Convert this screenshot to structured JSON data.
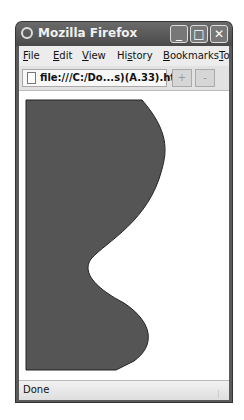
{
  "window": {
    "title": "Mozilla Firefox",
    "controls": {
      "minimize": "_",
      "maximize": "□",
      "close": "✕"
    }
  },
  "menubar": {
    "items": [
      {
        "label": "File",
        "accel": "F",
        "rest": "ile"
      },
      {
        "label": "Edit",
        "accel": "E",
        "rest": "dit"
      },
      {
        "label": "View",
        "accel": "V",
        "rest": "iew"
      },
      {
        "label": "History",
        "accel": "s",
        "pre": "Hi",
        "rest": "tory"
      },
      {
        "label": "Bookmarks",
        "accel": "B",
        "rest": "ookmarks"
      },
      {
        "label": "Tools",
        "accel": "T",
        "rest": "o"
      }
    ]
  },
  "toolbar": {
    "url": "file:///C:/Do...s)(A.33).html",
    "new_tab": "+",
    "tab_list": "-"
  },
  "content": {
    "shape_fill": "#555555",
    "shape_stroke": "#222222"
  },
  "status": {
    "text": "Done"
  }
}
